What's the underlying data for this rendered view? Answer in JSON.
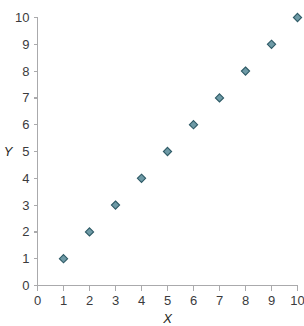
{
  "chart_data": {
    "type": "scatter",
    "title": "",
    "xlabel": "X",
    "ylabel": "Y",
    "xlim": [
      0,
      10
    ],
    "ylim": [
      0,
      10
    ],
    "grid": false,
    "legend": null,
    "x_ticks": [
      "0",
      "1",
      "2",
      "3",
      "4",
      "5",
      "6",
      "7",
      "8",
      "9",
      "10"
    ],
    "y_ticks": [
      "0",
      "1",
      "2",
      "3",
      "4",
      "5",
      "6",
      "7",
      "8",
      "9",
      "10"
    ],
    "series": [
      {
        "name": "",
        "marker": "diamond",
        "marker_fill": "#6e9aa6",
        "marker_stroke": "#2e5a66",
        "points": [
          {
            "x": 1,
            "y": 1
          },
          {
            "x": 2,
            "y": 2
          },
          {
            "x": 3,
            "y": 3
          },
          {
            "x": 4,
            "y": 4
          },
          {
            "x": 5,
            "y": 5
          },
          {
            "x": 6,
            "y": 6
          },
          {
            "x": 7,
            "y": 7
          },
          {
            "x": 8,
            "y": 8
          },
          {
            "x": 9,
            "y": 9
          },
          {
            "x": 10,
            "y": 10
          }
        ]
      }
    ]
  },
  "colors": {
    "background": "#ffffff",
    "axis": "#aaaaac",
    "tick_label": "#3b3b3d",
    "axis_title": "#1f1f21",
    "marker_fill": "#6e9aa6",
    "marker_stroke": "#2e5a66"
  }
}
